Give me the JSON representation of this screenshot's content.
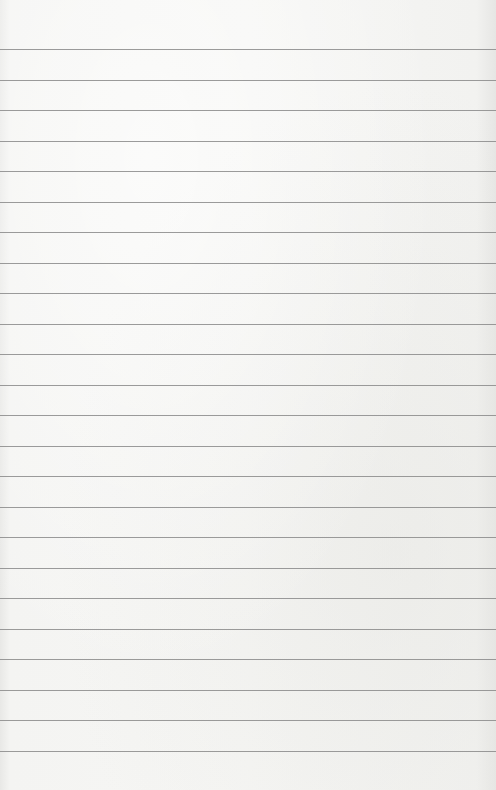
{
  "page": {
    "type": "lined-paper",
    "background_color": "#f3f3f1",
    "line_color": "#8a8a8a",
    "first_line_y": 49,
    "line_spacing": 30.52,
    "line_count": 24
  }
}
